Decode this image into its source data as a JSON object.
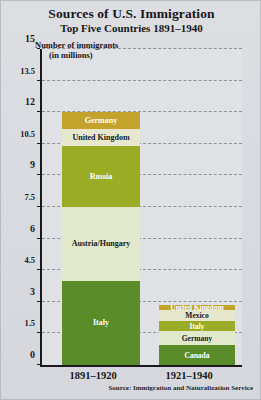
{
  "header": {
    "title": "Sources of U.S. Immigration",
    "subtitle": "Top Five Countries 1891–1940"
  },
  "axis_caption": {
    "line1": "Number of immigrants",
    "line2": "(in millions)"
  },
  "source_note": "Source: Immigration and Naturalization Service",
  "colors": {
    "figure_background": "#d9dbdf",
    "plot_background": "#dfe1e5",
    "axis": "#1b1b1f",
    "gridline": "#8f9298",
    "gold": "#c3a32c",
    "cream": "#e6e7cd",
    "olive": "#9aab25",
    "pale": "#e2e8cc",
    "green": "#5a8c2a"
  },
  "chart_data": {
    "type": "bar",
    "subtype": "stacked-bar",
    "title": "Sources of U.S. Immigration",
    "subtitle": "Top Five Countries 1891–1940",
    "xlabel": "",
    "ylabel": "Number of immigrants (in millions)",
    "ylim": [
      0,
      15
    ],
    "yticks": [
      0,
      1.5,
      3,
      4.5,
      6,
      7.5,
      9,
      10.5,
      12,
      13.5,
      15
    ],
    "ytick_labels": [
      "0",
      "1.5",
      "3",
      "4.5",
      "6",
      "7.5",
      "9",
      "10.5",
      "12",
      "13.5",
      "15"
    ],
    "grid": true,
    "grid_axis": "y",
    "grid_style": "dashed",
    "legend": false,
    "categories": [
      "1891–1920",
      "1921–1940"
    ],
    "bars": [
      {
        "category": "1891–1920",
        "total": 12.0,
        "segments": [
          {
            "label": "Italy",
            "value": 4.0,
            "color": "#5a8c2a",
            "text_color": "#ffffff"
          },
          {
            "label": "Austria/Hungary",
            "value": 3.5,
            "color": "#e2e8cc",
            "text_color": "#17171b"
          },
          {
            "label": "Russia",
            "value": 2.9,
            "color": "#9aab25",
            "text_color": "#ffffff"
          },
          {
            "label": "United Kingdom",
            "value": 0.8,
            "color": "#e6e7cd",
            "text_color": "#17171b"
          },
          {
            "label": "Germany",
            "value": 0.8,
            "color": "#c3a32c",
            "text_color": "#ffffff"
          }
        ]
      },
      {
        "category": "1921–1940",
        "total": 2.85,
        "segments": [
          {
            "label": "Canada",
            "value": 0.95,
            "color": "#5a8c2a",
            "text_color": "#ffffff"
          },
          {
            "label": "Germany",
            "value": 0.65,
            "color": "#e2e8cc",
            "text_color": "#17171b"
          },
          {
            "label": "Italy",
            "value": 0.5,
            "color": "#9aab25",
            "text_color": "#ffffff"
          },
          {
            "label": "Mexico",
            "value": 0.5,
            "color": "#e6e7cd",
            "text_color": "#17171b"
          },
          {
            "label": "United Kingdom",
            "value": 0.25,
            "color": "#c3a32c",
            "text_color": "#ffffff"
          }
        ]
      }
    ]
  }
}
